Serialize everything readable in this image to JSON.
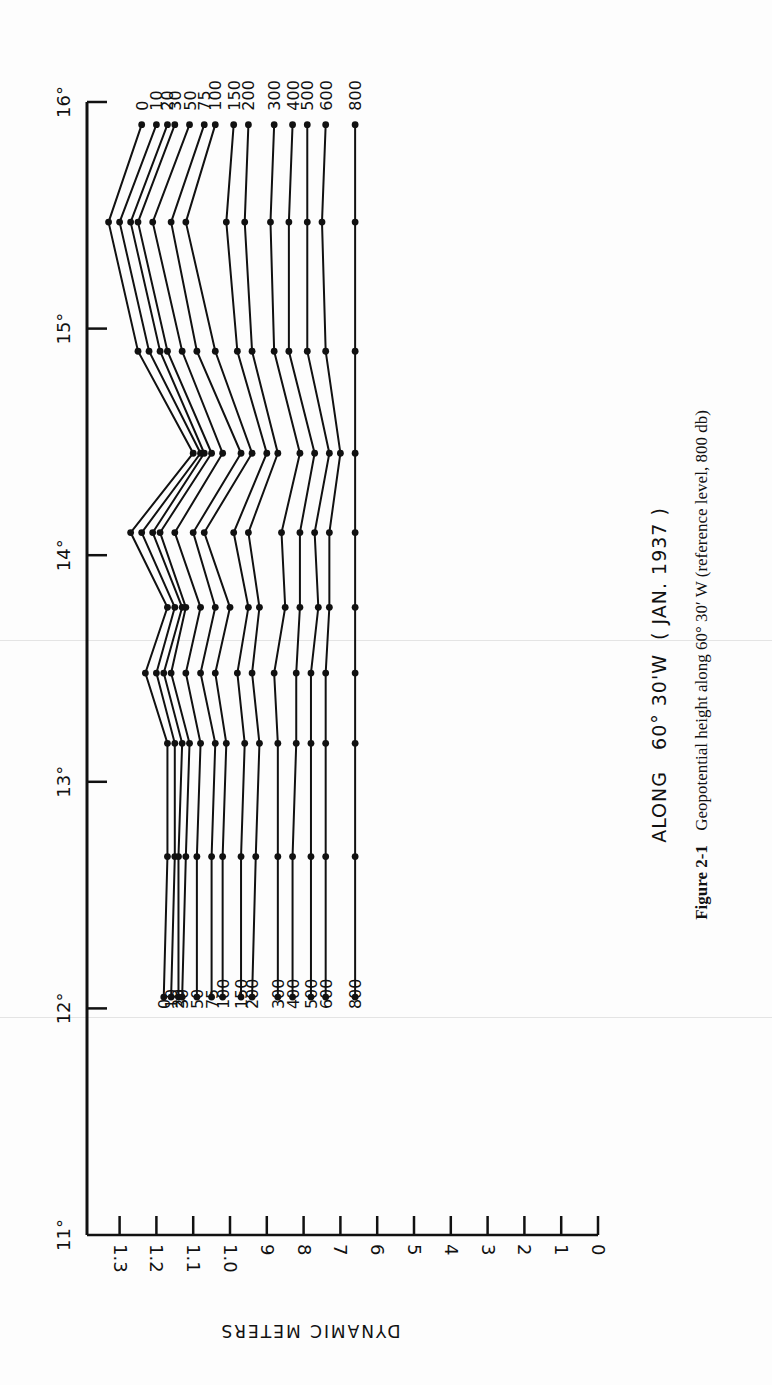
{
  "figure": {
    "title": "ALONG   60° 30'W  ( JAN. 1937 )",
    "caption_label": "Figure 2-1",
    "caption_text": "Geopotential height along 60° 30′ W (reference level, 800 db)"
  },
  "chart_data": {
    "type": "line",
    "orientation": "rotated-90-clockwise",
    "caption": "Figure 2-1 Geopotential height along 60° 30′ W (reference level, 800 db)",
    "xlabel": "Latitude (°N)",
    "ylabel": "DYNAMIC METERS",
    "x_ticks": [
      "11°",
      "12°",
      "13°",
      "14°",
      "15°",
      "16°"
    ],
    "xlim": [
      11,
      16
    ],
    "y_ticks": [
      "0",
      "1",
      "2",
      "3",
      "4",
      "5",
      "6",
      "7",
      "8",
      "9",
      "1.0",
      "1.1",
      "1.2",
      "1.3"
    ],
    "y_tick_values": [
      0,
      0.1,
      0.2,
      0.3,
      0.4,
      0.5,
      0.6,
      0.7,
      0.8,
      0.9,
      1.0,
      1.1,
      1.2,
      1.3
    ],
    "ylim": [
      0,
      1.3
    ],
    "grid": false,
    "legend": "series labels (pressure levels in db) printed at both ends of each curve",
    "x": [
      12.05,
      12.67,
      13.17,
      13.48,
      13.77,
      14.1,
      14.45,
      14.9,
      15.47,
      15.9
    ],
    "series": [
      {
        "name": "0",
        "values": [
          1.18,
          1.17,
          1.17,
          1.23,
          1.17,
          1.27,
          1.1,
          1.25,
          1.33,
          1.24
        ]
      },
      {
        "name": "10",
        "values": [
          1.16,
          1.15,
          1.15,
          1.2,
          1.15,
          1.24,
          1.08,
          1.22,
          1.3,
          1.2
        ]
      },
      {
        "name": "20",
        "values": [
          1.14,
          1.14,
          1.13,
          1.18,
          1.13,
          1.21,
          1.07,
          1.19,
          1.27,
          1.17
        ]
      },
      {
        "name": "30",
        "values": [
          1.13,
          1.12,
          1.11,
          1.16,
          1.12,
          1.19,
          1.05,
          1.17,
          1.25,
          1.15
        ]
      },
      {
        "name": "50",
        "values": [
          1.09,
          1.09,
          1.08,
          1.12,
          1.08,
          1.15,
          1.02,
          1.13,
          1.21,
          1.11
        ]
      },
      {
        "name": "75",
        "values": [
          1.05,
          1.05,
          1.04,
          1.08,
          1.04,
          1.1,
          0.97,
          1.09,
          1.16,
          1.07
        ]
      },
      {
        "name": "100",
        "values": [
          1.02,
          1.02,
          1.01,
          1.04,
          1.0,
          1.07,
          0.94,
          1.04,
          1.12,
          1.04
        ]
      },
      {
        "name": "150",
        "values": [
          0.97,
          0.97,
          0.96,
          0.98,
          0.95,
          0.99,
          0.9,
          0.98,
          1.01,
          0.99
        ]
      },
      {
        "name": "200",
        "values": [
          0.94,
          0.93,
          0.92,
          0.94,
          0.92,
          0.95,
          0.87,
          0.94,
          0.96,
          0.95
        ]
      },
      {
        "name": "300",
        "values": [
          0.87,
          0.87,
          0.87,
          0.88,
          0.85,
          0.86,
          0.81,
          0.88,
          0.89,
          0.88
        ]
      },
      {
        "name": "400",
        "values": [
          0.83,
          0.83,
          0.82,
          0.82,
          0.81,
          0.81,
          0.77,
          0.84,
          0.84,
          0.83
        ]
      },
      {
        "name": "500",
        "values": [
          0.78,
          0.78,
          0.78,
          0.78,
          0.76,
          0.77,
          0.73,
          0.79,
          0.79,
          0.79
        ]
      },
      {
        "name": "600",
        "values": [
          0.74,
          0.74,
          0.74,
          0.74,
          0.73,
          0.73,
          0.7,
          0.74,
          0.75,
          0.74
        ]
      },
      {
        "name": "800",
        "values": [
          0.66,
          0.66,
          0.66,
          0.66,
          0.66,
          0.66,
          0.66,
          0.66,
          0.66,
          0.66
        ]
      }
    ]
  },
  "axis": {
    "y_title": "DYNAMIC METERS"
  }
}
